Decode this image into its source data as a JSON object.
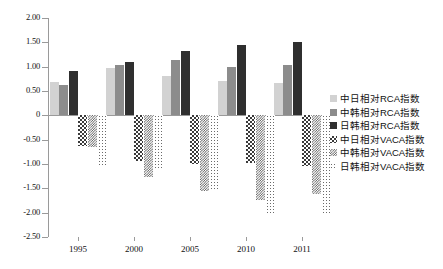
{
  "chart_data": {
    "type": "bar",
    "title": "",
    "xlabel": "",
    "ylabel": "",
    "categories": [
      "1995",
      "2000",
      "2005",
      "2010",
      "2011"
    ],
    "ylim": [
      -2.5,
      2.0
    ],
    "ytick_step": 0.5,
    "ytick_labels": [
      "2.00",
      "1.50",
      "1.00",
      "0.50",
      "0",
      "-0.50",
      "-1.00",
      "-1.50",
      "-2.00",
      "-2.50"
    ],
    "ytick_values": [
      2.0,
      1.5,
      1.0,
      0.5,
      0,
      -0.5,
      -1.0,
      -1.5,
      -2.0,
      -2.5
    ],
    "grid": false,
    "legend_position": "right",
    "series": [
      {
        "name": "中日相对RCA指数",
        "style": "light-gray",
        "color": "#d2d2d2",
        "values": [
          0.68,
          0.98,
          0.8,
          0.7,
          0.66
        ]
      },
      {
        "name": "中韩相对RCA指数",
        "style": "medium-gray",
        "color": "#8c8c8c",
        "values": [
          0.63,
          1.03,
          1.13,
          1.0,
          1.03
        ]
      },
      {
        "name": "日韩相对RCA指数",
        "style": "dark-gray",
        "color": "#2f2f2f",
        "values": [
          0.92,
          1.1,
          1.32,
          1.45,
          1.5
        ]
      },
      {
        "name": "中日相对VACA指数",
        "style": "checkerboard",
        "color": "#3a3a3a",
        "values": [
          -0.62,
          -0.93,
          -1.0,
          -0.97,
          -1.05
        ]
      },
      {
        "name": "中韩相对VACA指数",
        "style": "dense-hatch",
        "color": "#555555",
        "values": [
          -0.66,
          -1.27,
          -1.55,
          -1.75,
          -1.62
        ]
      },
      {
        "name": "日韩相对VACA指数",
        "style": "dotted",
        "color": "#6a6a6a",
        "values": [
          -1.05,
          -1.12,
          -1.55,
          -2.0,
          -2.05
        ]
      }
    ]
  }
}
